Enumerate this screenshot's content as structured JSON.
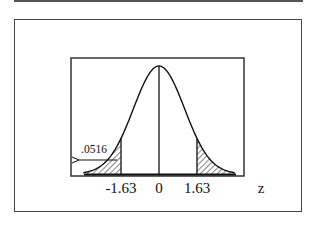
{
  "chart_data": {
    "type": "area",
    "title": "",
    "xlabel": "z",
    "ylabel": "",
    "x_range": [
      -3.2,
      3.2
    ],
    "distribution": {
      "name": "standard normal",
      "mean": 0,
      "sd": 1
    },
    "tick_labels": [
      "-1.63",
      "0",
      "1.63"
    ],
    "tick_values": [
      -1.63,
      0,
      1.63
    ],
    "shaded_regions": [
      {
        "from": "-inf",
        "to": -1.63,
        "area": 0.0516,
        "pattern": "hatched"
      },
      {
        "from": 1.63,
        "to": "inf",
        "pattern": "hatched"
      }
    ],
    "annotations": [
      {
        "text": ".0516",
        "points_to": "left tail area",
        "arrow": "left"
      }
    ],
    "center_line": {
      "x": 0
    },
    "grid": false,
    "legend": null
  },
  "labels": {
    "axis_name": "z",
    "tick_neg": "-1.63",
    "tick_zero": "0",
    "tick_pos": "1.63",
    "tail_area": ".0516"
  },
  "colors": {
    "ink": "#111111",
    "frame": "#444444",
    "background": "#ffffff"
  }
}
